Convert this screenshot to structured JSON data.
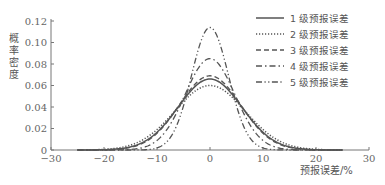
{
  "chart_data": {
    "type": "line",
    "title": "",
    "xlabel": "预报误差/%",
    "ylabel": "概率密度",
    "xlim": [
      -30,
      30
    ],
    "ylim": [
      0,
      0.12
    ],
    "xticks": [
      -30,
      -20,
      -10,
      0,
      10,
      20,
      30
    ],
    "xtick_labels": [
      "−30",
      "−20",
      "−10",
      "0",
      "10",
      "20",
      "30"
    ],
    "yticks": [
      0,
      0.02,
      0.04,
      0.06,
      0.08,
      0.1,
      0.12
    ],
    "ytick_labels": [
      "0",
      "0.02",
      "0.04",
      "0.06",
      "0.08",
      "0.10",
      "0.12"
    ],
    "grid": false,
    "legend_position": "upper right",
    "x_range_plotted": [
      -25,
      25
    ],
    "series": [
      {
        "name": "1 级预报误差",
        "style": "solid",
        "distribution": "normal",
        "mean": 0,
        "sigma": 6.0,
        "peak": 0.066
      },
      {
        "name": "2 级预报误差",
        "style": "dotted",
        "distribution": "normal",
        "mean": 0,
        "sigma": 6.6,
        "peak": 0.06
      },
      {
        "name": "3 级预报误差",
        "style": "dashed",
        "distribution": "normal",
        "mean": 0,
        "sigma": 5.8,
        "peak": 0.069
      },
      {
        "name": "4 级预报误差",
        "style": "dash-dot",
        "distribution": "normal",
        "mean": 0,
        "sigma": 4.7,
        "peak": 0.085
      },
      {
        "name": "5 级预报误差",
        "style": "dash-dot-dot",
        "distribution": "normal",
        "mean": 0,
        "sigma": 3.5,
        "peak": 0.114
      }
    ]
  },
  "colors": {
    "axis": "#777777",
    "line": "#555555",
    "text": "#555555"
  }
}
